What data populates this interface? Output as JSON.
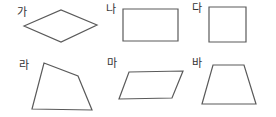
{
  "diagram": {
    "stroke_color": "#5a5a5a",
    "label_color": "#333333",
    "background": "#ffffff",
    "shapes": [
      {
        "id": "ga",
        "label": "가",
        "kind": "rhombus",
        "label_pos": [
          17,
          16
        ],
        "points": "24,26 61,10 97,25 61,42"
      },
      {
        "id": "na",
        "label": "나",
        "kind": "rectangle",
        "label_pos": [
          106,
          13
        ],
        "points": "123,9 178,9 178,41 123,41"
      },
      {
        "id": "da",
        "label": "다",
        "kind": "square",
        "label_pos": [
          192,
          12
        ],
        "points": "209,7 246,7 246,42 209,42"
      },
      {
        "id": "ra",
        "label": "라",
        "kind": "irregular-quadrilateral",
        "label_pos": [
          19,
          69
        ],
        "points": "44,63 78,76 92,110 32,109"
      },
      {
        "id": "ma",
        "label": "마",
        "kind": "parallelogram",
        "label_pos": [
          107,
          67
        ],
        "points": "129,72 183,71 172,98 119,99"
      },
      {
        "id": "ba",
        "label": "바",
        "kind": "trapezoid",
        "label_pos": [
          192,
          67
        ],
        "points": "213,65 244,65 256,104 202,104"
      }
    ]
  }
}
